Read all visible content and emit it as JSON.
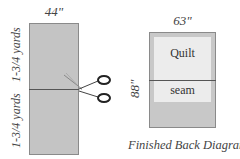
{
  "left_diagram": {
    "width_label": "44\"",
    "upper_length_label": "1-3/4 yards",
    "lower_length_label": "1-3/4 yards",
    "icon": "scissors-icon"
  },
  "right_diagram": {
    "width_label": "63\"",
    "height_label": "88\"",
    "quilt_label": "Quilt",
    "seam_label": "seam"
  },
  "caption": "Finished Back Diagram",
  "colors": {
    "fabric": "#c4c4c4",
    "quilt_area": "#ececec",
    "seam_line": "#555555"
  }
}
